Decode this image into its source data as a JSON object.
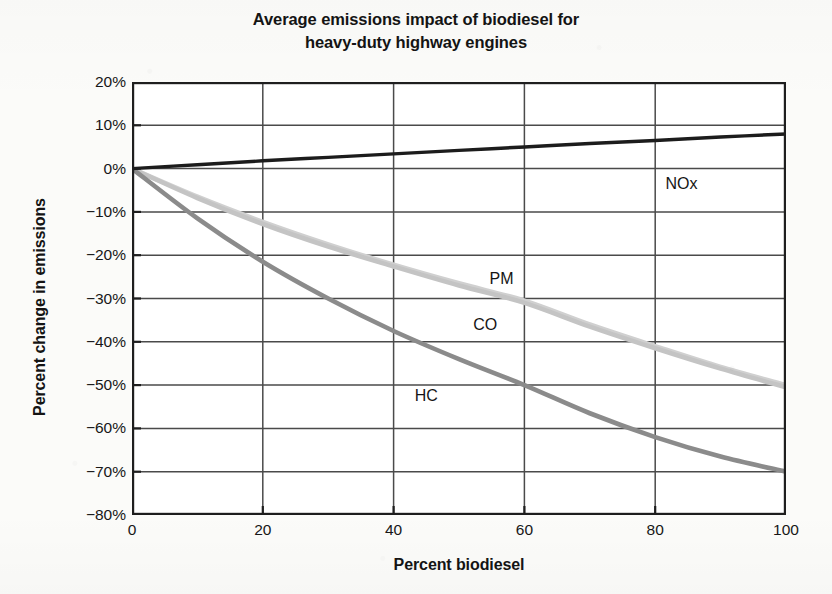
{
  "chart_data": {
    "type": "line",
    "title": "Average emissions impact of biodiesel for heavy-duty highway engines",
    "title_lines": [
      "Average emissions impact of biodiesel for",
      "heavy-duty highway engines"
    ],
    "xlabel": "Percent biodiesel",
    "ylabel": "Percent change in emissions",
    "xlim": [
      0,
      100
    ],
    "ylim": [
      -80,
      20
    ],
    "xticks": [
      0,
      20,
      40,
      60,
      80,
      100
    ],
    "xtick_labels": [
      "0",
      "20",
      "40",
      "60",
      "80",
      "100"
    ],
    "yticks": [
      20,
      10,
      0,
      -10,
      -20,
      -30,
      -40,
      -50,
      -60,
      -70,
      -80
    ],
    "ytick_labels": [
      "20%",
      "10%",
      "0%",
      "-10%",
      "-20%",
      "-30%",
      "-40%",
      "-50%",
      "-60%",
      "-70%",
      "-80%"
    ],
    "grid": true,
    "grid_axis": "both",
    "legend": "inline-labels",
    "x": [
      0,
      10,
      20,
      30,
      40,
      50,
      60,
      70,
      80,
      90,
      100
    ],
    "series": [
      {
        "name": "NOx",
        "color": "#1c1c1c",
        "width": 3.4,
        "values": [
          0,
          0.9,
          1.8,
          2.6,
          3.4,
          4.2,
          5.0,
          5.8,
          6.5,
          7.3,
          8.0
        ],
        "label_point": {
          "x": 84,
          "y": -3.5
        }
      },
      {
        "name": "PM",
        "color": "#d0d0d0",
        "width": 4.6,
        "values": [
          0,
          -6.5,
          -12.3,
          -17.5,
          -22.2,
          -26.5,
          -30.5,
          -36.0,
          -41.0,
          -45.8,
          -50.0
        ],
        "label_point": {
          "x": 56.5,
          "y": -25.5
        }
      },
      {
        "name": "CO",
        "color": "#c4c4c4",
        "width": 4.6,
        "values": [
          0,
          -6.8,
          -12.8,
          -18.0,
          -22.6,
          -27.0,
          -31.0,
          -36.5,
          -41.5,
          -46.2,
          -50.5
        ],
        "label_point": {
          "x": 54,
          "y": -36
        }
      },
      {
        "name": "HC",
        "color": "#8b8b8b",
        "width": 4.6,
        "values": [
          0,
          -11.5,
          -21.5,
          -30.0,
          -37.5,
          -44.0,
          -50.0,
          -56.5,
          -62.0,
          -66.5,
          -70.0
        ],
        "label_point": {
          "x": 45,
          "y": -52.5
        }
      }
    ],
    "axis_color": "#1e1e1e",
    "grid_color": "#4a4a4a",
    "background": "#ffffff",
    "page_background": "#fbfbf9"
  }
}
